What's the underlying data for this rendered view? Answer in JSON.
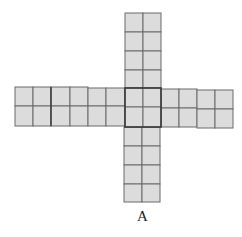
{
  "figure": {
    "label": "A",
    "cell_fill": "#dcdcdc",
    "grid_line_color": "#6a6a6a",
    "thick_line_color": "#3a3a3a"
  },
  "arms": {
    "top": {
      "cols": 2,
      "rows": 4
    },
    "left": {
      "cols": 6,
      "rows": 2
    },
    "center": {
      "cols": 2,
      "rows": 2
    },
    "right": {
      "cols": 4,
      "rows": 2
    },
    "bottom": {
      "cols": 2,
      "rows": 4
    }
  }
}
